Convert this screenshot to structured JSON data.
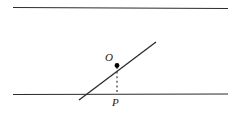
{
  "figure": {
    "type": "geometry-diagram",
    "canvas": {
      "width": 239,
      "height": 137
    },
    "background_color": "#ffffff",
    "stroke_color": "#2b2b2b",
    "dash_color": "#3a3a3a",
    "point_color": "#000000",
    "elements": {
      "top_line": {
        "name": "upper-parallel-line",
        "x1": 13,
        "y1": 7.5,
        "x2": 228,
        "y2": 8.5,
        "stroke_width": 1.1
      },
      "bottom_line": {
        "name": "lower-parallel-line",
        "x1": 13,
        "y1": 94.5,
        "x2": 228,
        "y2": 94.0,
        "stroke_width": 1.1
      },
      "diagonal_line": {
        "name": "transversal-ray",
        "x1": 79,
        "y1": 100,
        "x2": 156,
        "y2": 42,
        "stroke_width": 1.3
      },
      "dashed_segment": {
        "name": "perpendicular-dashed-segment",
        "x1": 117,
        "y1": 67,
        "x2": 117,
        "y2": 93,
        "stroke_width": 1.2,
        "dash_pattern": "2,2.6"
      },
      "point_O": {
        "name": "point-O",
        "cx": 117,
        "cy": 65.5,
        "r": 2.4
      }
    },
    "labels": {
      "O": "O",
      "P": "P"
    }
  }
}
